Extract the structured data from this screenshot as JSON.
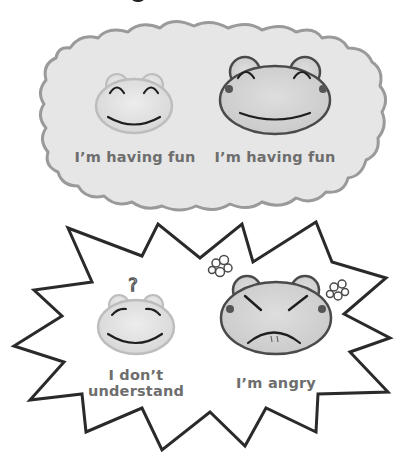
{
  "illustration": {
    "panels": [
      {
        "shape": "thought-cloud",
        "fill": "#e6e6e6",
        "outline": "#9a9a9a",
        "frogs": [
          {
            "expression": "happy",
            "size": "small",
            "caption": "I’m having fun"
          },
          {
            "expression": "happy",
            "size": "large",
            "caption": "I’m having fun"
          }
        ]
      },
      {
        "shape": "spiky-burst",
        "fill": "#ffffff",
        "outline": "#2a2a2a",
        "frogs": [
          {
            "expression": "confused",
            "size": "small",
            "caption_line1": "I don’t",
            "caption_line2": "understand",
            "symbol": "?"
          },
          {
            "expression": "angry",
            "size": "large",
            "caption": "I’m angry",
            "symbol": "anger-puffs"
          }
        ]
      }
    ],
    "colors": {
      "caption_text": "#6e6e6e",
      "frog_face": "#e2e2e2",
      "frog_outline_dark": "#4a4a4a",
      "frog_outline_light": "#b8b8b8",
      "line_art": "#1e1e1e"
    }
  }
}
